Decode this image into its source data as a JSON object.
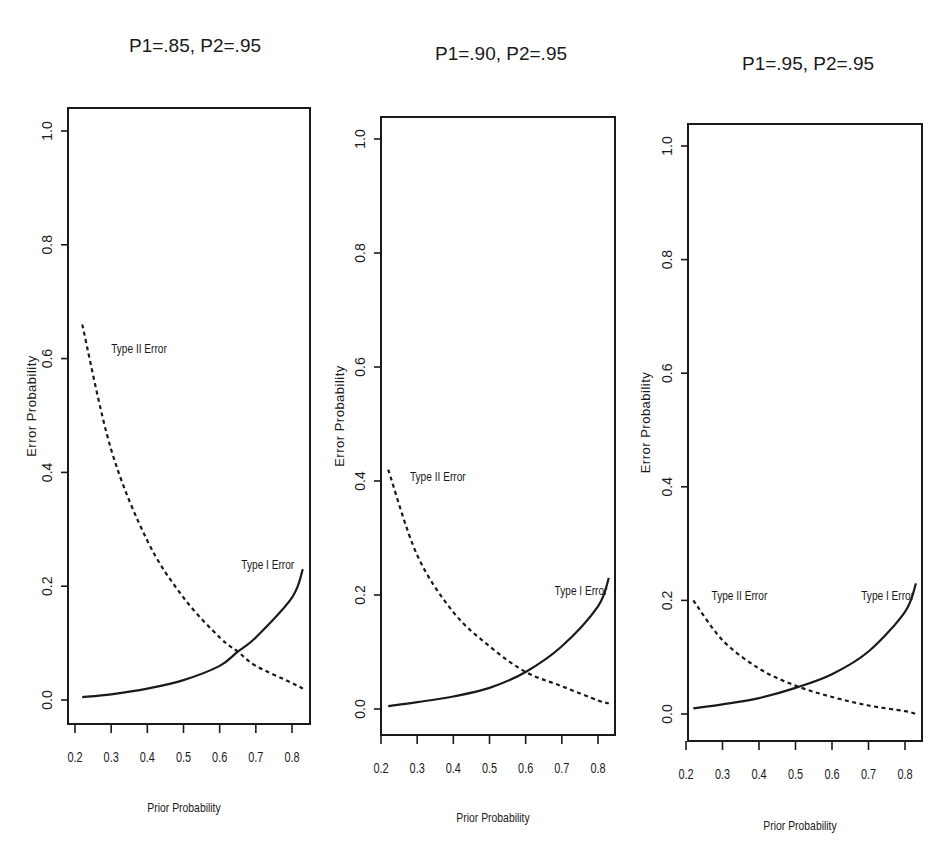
{
  "chart_data": [
    {
      "type": "line",
      "title": "P1=.85, P2=.95",
      "xlabel": "Prior Probability",
      "ylabel": "Error Probability",
      "xlim": [
        0.2,
        0.83
      ],
      "ylim": [
        0.0,
        1.0
      ],
      "xticks": [
        "0.2",
        "0.3",
        "0.4",
        "0.5",
        "0.6",
        "0.7",
        "0.8"
      ],
      "yticks": [
        "0.0",
        "0.2",
        "0.4",
        "0.6",
        "0.8",
        "1.0"
      ],
      "grid": false,
      "legend": "none (inline annotations)",
      "x": [
        0.22,
        0.3,
        0.4,
        0.5,
        0.6,
        0.65,
        0.7,
        0.8,
        0.83
      ],
      "series": [
        {
          "name": "Type II Error",
          "style": "dashed",
          "label_at": [
            0.3,
            0.61
          ],
          "values": [
            0.66,
            0.44,
            0.28,
            0.18,
            0.11,
            0.085,
            0.06,
            0.03,
            0.02
          ]
        },
        {
          "name": "Type I Error",
          "style": "solid",
          "label_at": [
            0.66,
            0.23
          ],
          "values": [
            0.005,
            0.01,
            0.02,
            0.035,
            0.06,
            0.085,
            0.11,
            0.18,
            0.23
          ]
        }
      ]
    },
    {
      "type": "line",
      "title": "P1=.90, P2=.95",
      "xlabel": "Prior Probability",
      "ylabel": "Error Probability",
      "xlim": [
        0.2,
        0.83
      ],
      "ylim": [
        0.0,
        1.0
      ],
      "xticks": [
        "0.2",
        "0.3",
        "0.4",
        "0.5",
        "0.6",
        "0.7",
        "0.8"
      ],
      "yticks": [
        "0.0",
        "0.2",
        "0.4",
        "0.6",
        "0.8",
        "1.0"
      ],
      "grid": false,
      "legend": "none (inline annotations)",
      "x": [
        0.22,
        0.3,
        0.4,
        0.5,
        0.6,
        0.7,
        0.8,
        0.83
      ],
      "series": [
        {
          "name": "Type II Error",
          "style": "dashed",
          "label_at": [
            0.28,
            0.4
          ],
          "values": [
            0.42,
            0.27,
            0.17,
            0.11,
            0.065,
            0.04,
            0.015,
            0.01
          ]
        },
        {
          "name": "Type I Error",
          "style": "solid",
          "label_at": [
            0.68,
            0.2
          ],
          "values": [
            0.005,
            0.012,
            0.022,
            0.037,
            0.065,
            0.11,
            0.18,
            0.23
          ]
        }
      ]
    },
    {
      "type": "line",
      "title": "P1=.95, P2=.95",
      "xlabel": "Prior Probability",
      "ylabel": "Error Probability",
      "xlim": [
        0.2,
        0.83
      ],
      "ylim": [
        0.0,
        1.0
      ],
      "xticks": [
        "0.2",
        "0.3",
        "0.4",
        "0.5",
        "0.6",
        "0.7",
        "0.8"
      ],
      "yticks": [
        "0.0",
        "0.2",
        "0.4",
        "0.6",
        "0.8",
        "1.0"
      ],
      "grid": false,
      "legend": "none (inline annotations)",
      "x": [
        0.22,
        0.3,
        0.4,
        0.5,
        0.6,
        0.7,
        0.8,
        0.83
      ],
      "series": [
        {
          "name": "Type II Error",
          "style": "dashed",
          "label_at": [
            0.27,
            0.2
          ],
          "values": [
            0.2,
            0.13,
            0.08,
            0.05,
            0.03,
            0.015,
            0.005,
            0.0
          ]
        },
        {
          "name": "Type I Error",
          "style": "solid",
          "label_at": [
            0.68,
            0.2
          ],
          "values": [
            0.01,
            0.017,
            0.028,
            0.046,
            0.07,
            0.11,
            0.18,
            0.23
          ]
        }
      ]
    }
  ],
  "layout": {
    "panels": [
      {
        "frame": [
          68,
          108,
          310,
          724
        ],
        "x0px": 75,
        "x1px": 292,
        "y0px": 700,
        "y1px": 131,
        "title_xy": [
          195,
          52
        ],
        "ylab_x": 36,
        "xlab_y": 812
      },
      {
        "frame": [
          381,
          117,
          615,
          735
        ],
        "x0px": 381,
        "x1px": 598,
        "y0px": 709,
        "y1px": 139,
        "title_xy": [
          501,
          60
        ],
        "ylab_x": 344,
        "xlab_y": 822
      },
      {
        "frame": [
          688,
          124,
          922,
          741
        ],
        "x0px": 686,
        "x1px": 905,
        "y0px": 714,
        "y1px": 146,
        "title_xy": [
          808,
          70
        ],
        "ylab_x": 650,
        "xlab_y": 830
      }
    ],
    "line_color": "#1a1a1a"
  }
}
